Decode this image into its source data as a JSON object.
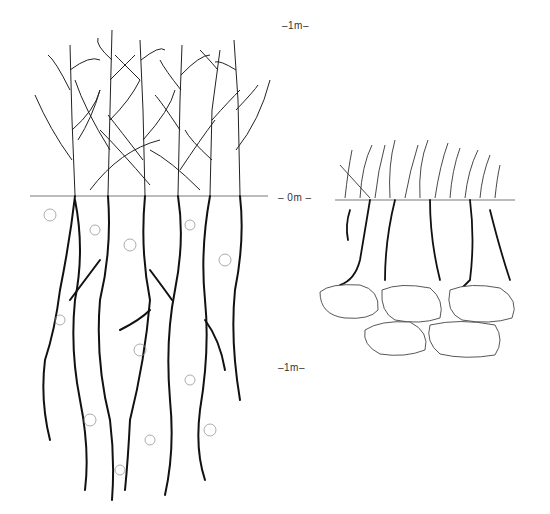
{
  "scale": {
    "top": "–1m–",
    "ground": "– 0m –",
    "bottom": "–1m–"
  },
  "figures": [
    {
      "name": "tall-crop-deep-roots",
      "description": "Tall cereal plants with deep, extensive roots in loose soil"
    },
    {
      "name": "short-grass-shallow-roots",
      "description": "Short grass with shallow roots above a stony layer"
    }
  ],
  "colors": {
    "ink": "#1a1a1a",
    "soil_dots": "#999999",
    "background": "#ffffff"
  }
}
